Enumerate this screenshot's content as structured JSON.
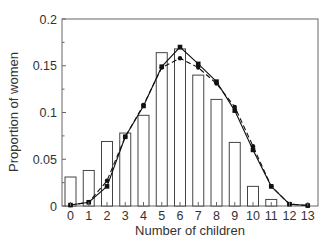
{
  "chart_data": {
    "type": "bar",
    "title": "",
    "xlabel": "Number of children",
    "ylabel": "Proportion of women",
    "ylim": [
      0,
      0.2
    ],
    "xlim": [
      -0.5,
      13.5
    ],
    "grid": false,
    "legend": null,
    "yticks": [
      "0",
      "0.05",
      "0.1",
      "0.15",
      "0.2"
    ],
    "ytick_values": [
      0,
      0.05,
      0.1,
      0.15,
      0.2
    ],
    "categories": [
      "0",
      "1",
      "2",
      "3",
      "4",
      "5",
      "6",
      "7",
      "8",
      "9",
      "10",
      "11",
      "12",
      "13"
    ],
    "x": [
      0,
      1,
      2,
      3,
      4,
      5,
      6,
      7,
      8,
      9,
      10,
      11,
      12,
      13
    ],
    "series": [
      {
        "name": "Observed (bars)",
        "type": "bar",
        "style": "open rectangles",
        "values": [
          0.031,
          0.038,
          0.069,
          0.078,
          0.097,
          0.164,
          0.168,
          0.14,
          0.114,
          0.068,
          0.021,
          0.007,
          0.0,
          0.0
        ]
      },
      {
        "name": "Model 1 (solid line, square markers)",
        "type": "line",
        "style": "solid",
        "marker": "square",
        "values": [
          0.001,
          0.004,
          0.021,
          0.074,
          0.107,
          0.149,
          0.17,
          0.152,
          0.133,
          0.102,
          0.06,
          0.021,
          0.002,
          0.0005
        ]
      },
      {
        "name": "Model 2 (dashed line, circle markers)",
        "type": "line",
        "style": "dashed",
        "marker": "circle",
        "values": [
          0.001,
          0.004,
          0.027,
          0.074,
          0.108,
          0.148,
          0.158,
          0.148,
          0.131,
          0.106,
          0.064,
          0.021,
          0.002,
          0.0005
        ]
      }
    ],
    "colors": {
      "axis": "#555555",
      "bars": "#444444",
      "lines": "#111111",
      "background": "#ffffff"
    }
  }
}
